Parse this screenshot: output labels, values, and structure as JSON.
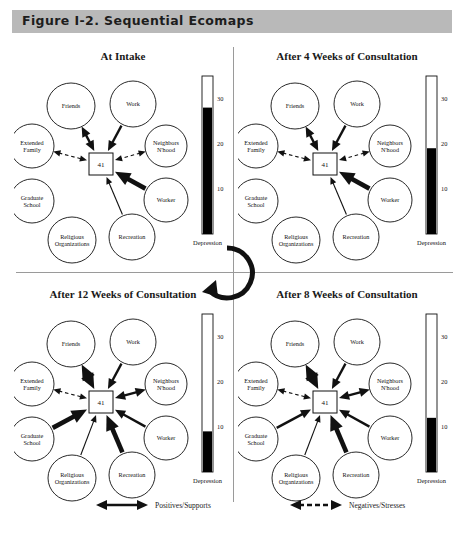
{
  "figure": {
    "title": "Figure I-2. Sequential Ecomaps",
    "banner_color": "#b9b9b9"
  },
  "center_node_value": "41",
  "node_labels": {
    "friends": "Friends",
    "work": "Work",
    "extended_family": "Extended\nFamily",
    "extended_family_l1": "Extended",
    "extended_family_l2": "Family",
    "neighbors_l1": "Neighbors",
    "neighbors_l2": "N'hood",
    "graduate_l1": "Graduate",
    "graduate_l2": "School",
    "worker": "Worker",
    "religious_l1": "Religious",
    "religious_l2": "Organizations",
    "recreation": "Recreation"
  },
  "thermometer": {
    "axis_label": "Depression",
    "ticks": [
      "30",
      "20",
      "10"
    ],
    "scale_max": 35,
    "scale_min": 0
  },
  "panels": [
    {
      "id": "at-intake",
      "title": "At Intake",
      "depression_value": 28,
      "edges": [
        {
          "to": "friends",
          "type": "positive",
          "weight": "medium",
          "arrows": "both"
        },
        {
          "to": "work",
          "type": "positive",
          "weight": "medium",
          "arrows": "in"
        },
        {
          "to": "extended_family",
          "type": "negative",
          "weight": "thin",
          "arrows": "both"
        },
        {
          "to": "neighbors",
          "type": "negative",
          "weight": "thin",
          "arrows": "both"
        },
        {
          "to": "worker",
          "type": "positive",
          "weight": "heavy",
          "arrows": "in"
        },
        {
          "to": "recreation",
          "type": "positive",
          "weight": "thin",
          "arrows": "in"
        }
      ]
    },
    {
      "id": "after-4-weeks",
      "title": "After 4 Weeks of Consultation",
      "depression_value": 19,
      "edges": [
        {
          "to": "friends",
          "type": "positive",
          "weight": "medium",
          "arrows": "both"
        },
        {
          "to": "work",
          "type": "positive",
          "weight": "medium",
          "arrows": "in"
        },
        {
          "to": "extended_family",
          "type": "negative",
          "weight": "thin",
          "arrows": "both"
        },
        {
          "to": "neighbors",
          "type": "negative",
          "weight": "thin",
          "arrows": "both"
        },
        {
          "to": "worker",
          "type": "positive",
          "weight": "heavy",
          "arrows": "in"
        },
        {
          "to": "recreation",
          "type": "positive",
          "weight": "thin",
          "arrows": "in"
        }
      ]
    },
    {
      "id": "after-8-weeks",
      "title": "After 8 Weeks of Consultation",
      "depression_value": 12,
      "edges": [
        {
          "to": "friends",
          "type": "positive",
          "weight": "heavy",
          "arrows": "both"
        },
        {
          "to": "work",
          "type": "positive",
          "weight": "medium",
          "arrows": "in"
        },
        {
          "to": "extended_family",
          "type": "negative",
          "weight": "thin",
          "arrows": "both"
        },
        {
          "to": "neighbors",
          "type": "positive",
          "weight": "medium",
          "arrows": "both"
        },
        {
          "to": "graduate_school",
          "type": "positive",
          "weight": "medium",
          "arrows": "in"
        },
        {
          "to": "worker",
          "type": "positive",
          "weight": "medium",
          "arrows": "in"
        },
        {
          "to": "recreation",
          "type": "positive",
          "weight": "heavy",
          "arrows": "in"
        },
        {
          "to": "religious",
          "type": "positive",
          "weight": "thin",
          "arrows": "in"
        }
      ]
    },
    {
      "id": "after-12-weeks",
      "title": "After 12 Weeks of Consultation",
      "depression_value": 9,
      "edges": [
        {
          "to": "friends",
          "type": "positive",
          "weight": "heavy",
          "arrows": "both"
        },
        {
          "to": "work",
          "type": "positive",
          "weight": "medium",
          "arrows": "in"
        },
        {
          "to": "extended_family",
          "type": "negative",
          "weight": "thin",
          "arrows": "both"
        },
        {
          "to": "neighbors",
          "type": "positive",
          "weight": "medium",
          "arrows": "both"
        },
        {
          "to": "graduate_school",
          "type": "positive",
          "weight": "heavy",
          "arrows": "in"
        },
        {
          "to": "worker",
          "type": "positive",
          "weight": "medium",
          "arrows": "in"
        },
        {
          "to": "recreation",
          "type": "positive",
          "weight": "heavy",
          "arrows": "in"
        },
        {
          "to": "religious",
          "type": "positive",
          "weight": "thin",
          "arrows": "in"
        }
      ]
    }
  ],
  "legend": {
    "positive_label": "Positives/Supports",
    "negative_label": "Negatives/Stresses"
  },
  "sequence_arrow": {
    "name": "clockwise-sequence-arrow",
    "direction": "clockwise"
  },
  "colors": {
    "ink": "#111111",
    "rule": "#9a9a9a",
    "banner": "#b9b9b9",
    "fill": "#000000"
  }
}
